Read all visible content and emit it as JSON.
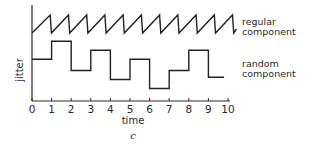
{
  "figure": {
    "panel_label": "c",
    "xlabel": "time",
    "ylabel": "jitter"
  },
  "chart_data": {
    "type": "line",
    "title": "",
    "xlabel": "time",
    "ylabel": "jitter",
    "xlim": [
      0,
      10
    ],
    "x_ticks": [
      0,
      1,
      2,
      3,
      4,
      5,
      6,
      7,
      8,
      9,
      10
    ],
    "grid": false,
    "legend_position": "right (inline labels)",
    "series": [
      {
        "name": "regular component",
        "label_lines": [
          "regular",
          "component"
        ],
        "shape": "sawtooth",
        "period": 0.93,
        "teeth": 11,
        "level_low": 0,
        "level_high": 1
      },
      {
        "name": "random component",
        "label_lines": [
          "random",
          "component"
        ],
        "shape": "step",
        "x": [
          0,
          1,
          2,
          3,
          4,
          5,
          6,
          7,
          8,
          9,
          9.8
        ],
        "values": [
          0.35,
          0.75,
          0.1,
          0.55,
          -0.1,
          0.35,
          -0.3,
          0.1,
          0.55,
          -0.05,
          -0.05
        ]
      }
    ],
    "caption": "c"
  }
}
